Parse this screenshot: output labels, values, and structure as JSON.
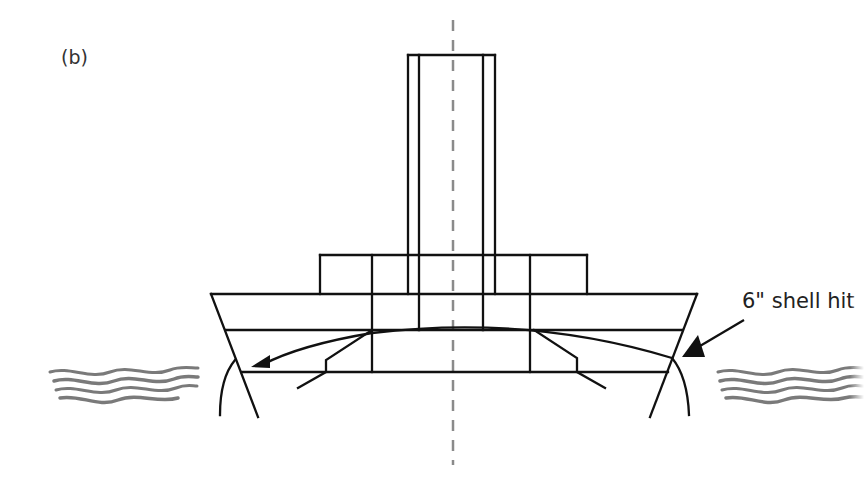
{
  "figure": {
    "panel_label": "(b)",
    "annotation": "6\" shell hit",
    "colors": {
      "line": "#111111",
      "centerline": "#8a8a8a",
      "water": "#7a7a7a",
      "text": "#222222"
    },
    "elements": {
      "centerline": "vertical dashed centerline",
      "funnel": "funnel / stack",
      "superstructure": "superstructure block",
      "hull": "hull cross-section",
      "decks": [
        "upper deck",
        "middle deck",
        "lower deck"
      ],
      "shell_trajectory": "curved shell trajectory",
      "torpedo_bulkheads": [
        "port torpedo bulkhead",
        "starboard torpedo bulkhead"
      ],
      "bulges": [
        "port bulge",
        "starboard bulge"
      ],
      "water": [
        "port waves",
        "starboard waves"
      ],
      "arrows": [
        "trajectory arrowhead",
        "impact pointer arrow"
      ]
    }
  }
}
